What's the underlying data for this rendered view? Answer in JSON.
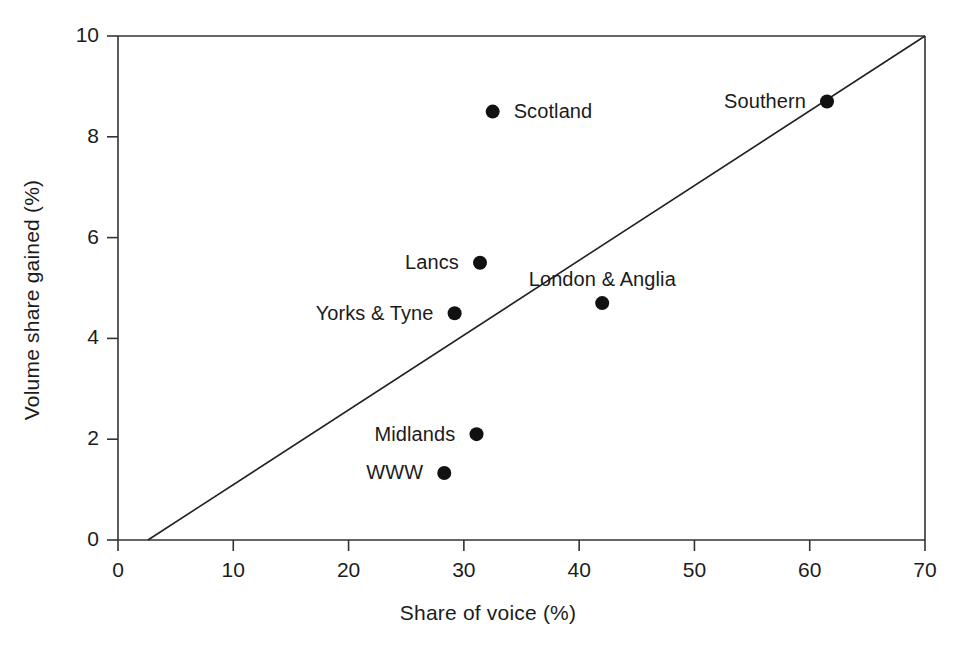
{
  "chart_data": {
    "type": "scatter",
    "title": "",
    "xlabel": "Share of voice (%)",
    "ylabel": "Volume share gained (%)",
    "xlim": [
      0,
      70
    ],
    "ylim": [
      0,
      10
    ],
    "xticks": [
      0,
      10,
      20,
      30,
      40,
      50,
      60,
      70
    ],
    "yticks": [
      0,
      2,
      4,
      6,
      8,
      10
    ],
    "xtick_labels": [
      "0",
      "10",
      "20",
      "30",
      "40",
      "50",
      "60",
      "70"
    ],
    "ytick_labels": [
      "0",
      "2",
      "4",
      "6",
      "8",
      "10"
    ],
    "grid": false,
    "legend": "none",
    "point_color": "#111111",
    "line_color": "#222222",
    "axis_color": "#333333",
    "points": [
      {
        "label": "Scotland",
        "x": 32.5,
        "y": 8.5,
        "label_side": "right"
      },
      {
        "label": "Southern",
        "x": 61.5,
        "y": 8.7,
        "label_side": "left"
      },
      {
        "label": "Lancs",
        "x": 31.4,
        "y": 5.5,
        "label_side": "left"
      },
      {
        "label": "London & Anglia",
        "x": 42.0,
        "y": 4.7,
        "label_side": "above"
      },
      {
        "label": "Yorks & Tyne",
        "x": 29.2,
        "y": 4.5,
        "label_side": "left"
      },
      {
        "label": "Midlands",
        "x": 31.1,
        "y": 2.1,
        "label_side": "left"
      },
      {
        "label": "WWW",
        "x": 28.3,
        "y": 1.33,
        "label_side": "left"
      }
    ],
    "reference_line": {
      "name": "parity-line",
      "x0": 2.6,
      "y0": 0.0,
      "x1": 70.0,
      "y1": 10.0
    }
  }
}
